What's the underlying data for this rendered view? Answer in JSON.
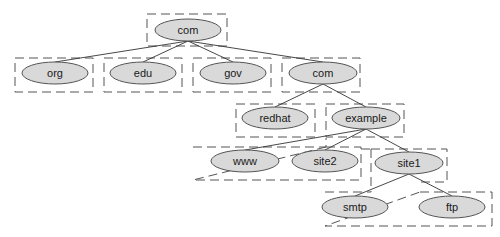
{
  "diagram": {
    "colors": {
      "node_fill": "#d9d9d9",
      "node_stroke": "#555555",
      "edge": "#333333",
      "zone_border": "#555555",
      "background": "#ffffff"
    },
    "nodes": [
      {
        "id": "root-com",
        "label": "com",
        "cx": 188,
        "cy": 30,
        "rx": 33,
        "ry": 11
      },
      {
        "id": "org",
        "label": "org",
        "cx": 55,
        "cy": 73,
        "rx": 33,
        "ry": 11
      },
      {
        "id": "edu",
        "label": "edu",
        "cx": 143,
        "cy": 73,
        "rx": 33,
        "ry": 11
      },
      {
        "id": "gov",
        "label": "gov",
        "cx": 233,
        "cy": 73,
        "rx": 33,
        "ry": 11
      },
      {
        "id": "com",
        "label": "com",
        "cx": 323,
        "cy": 73,
        "rx": 34,
        "ry": 11
      },
      {
        "id": "redhat",
        "label": "redhat",
        "cx": 275,
        "cy": 118,
        "rx": 33,
        "ry": 11
      },
      {
        "id": "example",
        "label": "example",
        "cx": 366,
        "cy": 118,
        "rx": 34,
        "ry": 11
      },
      {
        "id": "www",
        "label": "www",
        "cx": 245,
        "cy": 161,
        "rx": 34,
        "ry": 11
      },
      {
        "id": "site2",
        "label": "site2",
        "cx": 325,
        "cy": 161,
        "rx": 33,
        "ry": 11
      },
      {
        "id": "site1",
        "label": "site1",
        "cx": 409,
        "cy": 163,
        "rx": 34,
        "ry": 11
      },
      {
        "id": "smtp",
        "label": "smtp",
        "cx": 355,
        "cy": 207,
        "rx": 33,
        "ry": 11
      },
      {
        "id": "ftp",
        "label": "ftp",
        "cx": 452,
        "cy": 207,
        "rx": 33,
        "ry": 11
      }
    ],
    "edges": [
      {
        "from": "root-com",
        "to": "org",
        "x1": 188,
        "y1": 41,
        "x2": 55,
        "y2": 62
      },
      {
        "from": "root-com",
        "to": "edu",
        "x1": 188,
        "y1": 41,
        "x2": 143,
        "y2": 62
      },
      {
        "from": "root-com",
        "to": "gov",
        "x1": 188,
        "y1": 41,
        "x2": 233,
        "y2": 62
      },
      {
        "from": "root-com",
        "to": "com",
        "x1": 188,
        "y1": 41,
        "x2": 323,
        "y2": 62
      },
      {
        "from": "com",
        "to": "redhat",
        "x1": 323,
        "y1": 84,
        "x2": 275,
        "y2": 107
      },
      {
        "from": "com",
        "to": "example",
        "x1": 323,
        "y1": 84,
        "x2": 366,
        "y2": 107
      },
      {
        "from": "example",
        "to": "www",
        "x1": 366,
        "y1": 129,
        "x2": 245,
        "y2": 150
      },
      {
        "from": "example",
        "to": "site2",
        "x1": 366,
        "y1": 129,
        "x2": 325,
        "y2": 150
      },
      {
        "from": "example",
        "to": "site1",
        "x1": 366,
        "y1": 129,
        "x2": 409,
        "y2": 152
      },
      {
        "from": "site1",
        "to": "smtp",
        "x1": 409,
        "y1": 174,
        "x2": 355,
        "y2": 196
      },
      {
        "from": "site1",
        "to": "ftp",
        "x1": 409,
        "y1": 174,
        "x2": 452,
        "y2": 196
      }
    ],
    "zones": [
      {
        "id": "zone-root-com",
        "label": "com zone",
        "points": "147,14 227,14 227,46 147,46"
      },
      {
        "id": "zone-org",
        "label": "org zone",
        "points": "15,58 93,58 93,92 15,92"
      },
      {
        "id": "zone-edu",
        "label": "edu zone",
        "points": "104,58 182,58 182,92 104,92"
      },
      {
        "id": "zone-gov",
        "label": "gov zone",
        "points": "193,58 271,58 271,92 193,92"
      },
      {
        "id": "zone-com",
        "label": "com zone",
        "points": "282,58 360,58 360,92 282,92"
      },
      {
        "id": "zone-redhat",
        "label": "redhat zone",
        "points": "236,104 315,104 315,136 236,136"
      },
      {
        "id": "zone-example",
        "label": "example zone",
        "points": "326,104 404,104 404,136 326,136"
      },
      {
        "id": "zone-www-site2",
        "label": "www and site2 zone",
        "points": "193,147 326,147 326,136 ... "
      },
      {
        "id": "zone-site1",
        "label": "site1 zone",
        "points": ""
      },
      {
        "id": "zone-smtp-ftp",
        "label": "smtp and ftp zone",
        "points": ""
      }
    ],
    "zone_paths": {
      "zone-www-site2": "M 193 147 L 326 147 L 326 138 M 326 147 L 361 147 L 361 180 L 193 180 Z",
      "zone-site1": "M 361 149 L 371 149 M 371 149 L 447 149 L 447 182 L 420 182 M 371 149 L 371 192",
      "zone-smtp-ftp": "M 325 192 L 371 192 M 420 192 L 492 192 L 492 226 L 325 226 Z"
    }
  }
}
